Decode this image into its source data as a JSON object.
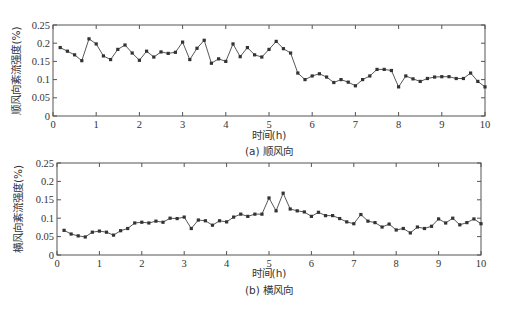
{
  "chart_data": [
    {
      "type": "line",
      "title": "(a) 顺风向",
      "caption": "(a) 顺风向",
      "xlabel": "时间(h)",
      "ylabel": "顺风向紊流强度(%)",
      "xlim": [
        0,
        10
      ],
      "ylim": [
        0,
        0.25
      ],
      "xticks": [
        "0",
        "1",
        "2",
        "3",
        "4",
        "5",
        "6",
        "7",
        "8",
        "9",
        "10"
      ],
      "yticks": [
        "0",
        "0.05",
        "0.1",
        "0.15",
        "0.2",
        "0.25"
      ],
      "grid": false,
      "legend": null,
      "x_step": 0.16667,
      "x_start": 0.16667,
      "series": [
        {
          "name": "顺风向",
          "values": [
            0.188,
            0.178,
            0.168,
            0.152,
            0.212,
            0.198,
            0.165,
            0.155,
            0.183,
            0.195,
            0.173,
            0.153,
            0.178,
            0.162,
            0.176,
            0.172,
            0.175,
            0.203,
            0.155,
            0.186,
            0.208,
            0.145,
            0.157,
            0.15,
            0.198,
            0.163,
            0.188,
            0.168,
            0.162,
            0.183,
            0.205,
            0.185,
            0.173,
            0.118,
            0.1,
            0.11,
            0.116,
            0.107,
            0.092,
            0.1,
            0.093,
            0.083,
            0.1,
            0.11,
            0.128,
            0.128,
            0.125,
            0.08,
            0.11,
            0.102,
            0.095,
            0.103,
            0.107,
            0.108,
            0.108,
            0.103,
            0.103,
            0.118,
            0.095,
            0.08
          ]
        }
      ]
    },
    {
      "type": "line",
      "title": "(b) 横风向",
      "caption": "(b) 横风向",
      "xlabel": "时间(h)",
      "ylabel": "横风向紊流强度(%)",
      "xlim": [
        0,
        10
      ],
      "ylim": [
        0,
        0.25
      ],
      "xticks": [
        "0",
        "1",
        "2",
        "3",
        "4",
        "5",
        "6",
        "7",
        "8",
        "9",
        "10"
      ],
      "yticks": [
        "0",
        "0.05",
        "0.1",
        "0.15",
        "0.2",
        "0.25"
      ],
      "grid": false,
      "legend": null,
      "x_step": 0.16667,
      "x_start": 0.16667,
      "series": [
        {
          "name": "横风向",
          "values": [
            0.067,
            0.057,
            0.052,
            0.049,
            0.062,
            0.065,
            0.062,
            0.054,
            0.066,
            0.072,
            0.087,
            0.089,
            0.087,
            0.092,
            0.089,
            0.1,
            0.099,
            0.103,
            0.072,
            0.095,
            0.093,
            0.081,
            0.093,
            0.09,
            0.103,
            0.111,
            0.105,
            0.111,
            0.111,
            0.155,
            0.12,
            0.168,
            0.125,
            0.12,
            0.117,
            0.105,
            0.116,
            0.107,
            0.107,
            0.099,
            0.09,
            0.085,
            0.11,
            0.092,
            0.088,
            0.076,
            0.084,
            0.068,
            0.072,
            0.06,
            0.076,
            0.072,
            0.078,
            0.098,
            0.087,
            0.1,
            0.082,
            0.088,
            0.098,
            0.085
          ]
        }
      ]
    }
  ],
  "style": {
    "line_color": "#444444",
    "marker_color": "#333333",
    "axis_color": "#555555"
  }
}
